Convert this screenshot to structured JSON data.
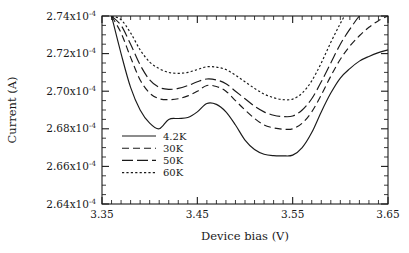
{
  "figure": {
    "background": "#ffffff",
    "ink_color": "#1a1a1a"
  },
  "axes": {
    "x_title": "Device bias (V)",
    "y_title": "Current (A)",
    "x_tick_labels": [
      "3.35",
      "3.45",
      "3.55",
      "3.65"
    ],
    "y_tick_mantissas": [
      "2.64",
      "2.66",
      "2.68",
      "2.70",
      "2.72",
      "2.74"
    ],
    "y_tick_base": "x10",
    "y_tick_exponent": "-4"
  },
  "legend": {
    "entries": [
      {
        "label": "4.2K",
        "style": "solid"
      },
      {
        "label": "30K",
        "style": "dashed"
      },
      {
        "label": "50K",
        "style": "longdash"
      },
      {
        "label": "60K",
        "style": "dotted"
      }
    ]
  },
  "chart_data": {
    "type": "line",
    "title": "",
    "xlabel": "Device bias (V)",
    "ylabel": "Current (A)",
    "xlim": [
      3.35,
      3.65
    ],
    "ylim": [
      0.000264,
      0.000274
    ],
    "x_major_ticks": [
      3.35,
      3.45,
      3.55,
      3.65
    ],
    "x_minor_tick_step": 0.01,
    "y_major_ticks": [
      0.000264,
      0.000266,
      0.000268,
      0.00027,
      0.000272,
      0.000274
    ],
    "y_minor_tick_step": 5e-07,
    "grid": false,
    "legend_position": "center-left-inside",
    "x": [
      3.36,
      3.37,
      3.38,
      3.39,
      3.4,
      3.41,
      3.42,
      3.43,
      3.44,
      3.45,
      3.46,
      3.47,
      3.48,
      3.49,
      3.5,
      3.51,
      3.52,
      3.53,
      3.54,
      3.55,
      3.56,
      3.57,
      3.58,
      3.59,
      3.6,
      3.61,
      3.62,
      3.63,
      3.64,
      3.65
    ],
    "series": [
      {
        "name": "4.2K",
        "style": "solid",
        "values": [
          0.000274,
          0.000272,
          0.0002702,
          0.000269,
          0.0002683,
          0.000268,
          0.0002685,
          0.00026855,
          0.0002686,
          0.0002689,
          0.00026935,
          0.0002693,
          0.0002689,
          0.0002682,
          0.0002674,
          0.0002669,
          0.00026665,
          0.00026657,
          0.00026656,
          0.0002666,
          0.000267,
          0.0002678,
          0.0002689,
          0.0002699,
          0.0002707,
          0.0002712,
          0.0002716,
          0.00027185,
          0.00027205,
          0.0002722
        ]
      },
      {
        "name": "30K",
        "style": "dashed",
        "values": [
          0.000274,
          0.0002731,
          0.0002718,
          0.0002706,
          0.0002699,
          0.0002696,
          0.00026955,
          0.0002696,
          0.00026975,
          0.00027,
          0.0002703,
          0.00027025,
          0.00027,
          0.0002695,
          0.000269,
          0.00026855,
          0.0002682,
          0.00026805,
          0.00026798,
          0.000268,
          0.0002683,
          0.0002689,
          0.0002698,
          0.0002708,
          0.0002717,
          0.0002724,
          0.00027295,
          0.0002734,
          0.00027375,
          0.000274
        ]
      },
      {
        "name": "50K",
        "style": "longdash",
        "values": [
          0.000274,
          0.0002735,
          0.0002725,
          0.0002714,
          0.0002706,
          0.0002702,
          0.0002701,
          0.00027015,
          0.0002703,
          0.0002705,
          0.00027065,
          0.0002706,
          0.0002704,
          0.00027,
          0.0002696,
          0.0002692,
          0.0002689,
          0.00026872,
          0.00026865,
          0.00026868,
          0.000269,
          0.0002696,
          0.0002705,
          0.0002715,
          0.0002725,
          0.0002733,
          0.000274,
          0.0002745,
          0.0002749,
          0.0002752
        ]
      },
      {
        "name": "60K",
        "style": "dotted",
        "values": [
          0.000274,
          0.0002738,
          0.0002731,
          0.0002722,
          0.00027155,
          0.0002712,
          0.000271,
          0.00027095,
          0.000271,
          0.00027115,
          0.0002713,
          0.00027128,
          0.00027115,
          0.00027085,
          0.0002705,
          0.00027015,
          0.00026985,
          0.00026965,
          0.00026955,
          0.00026958,
          0.0002699,
          0.00027055,
          0.0002715,
          0.0002726,
          0.0002736,
          0.0002745,
          0.0002752,
          0.0002758,
          0.0002762,
          0.0002765
        ]
      }
    ]
  }
}
